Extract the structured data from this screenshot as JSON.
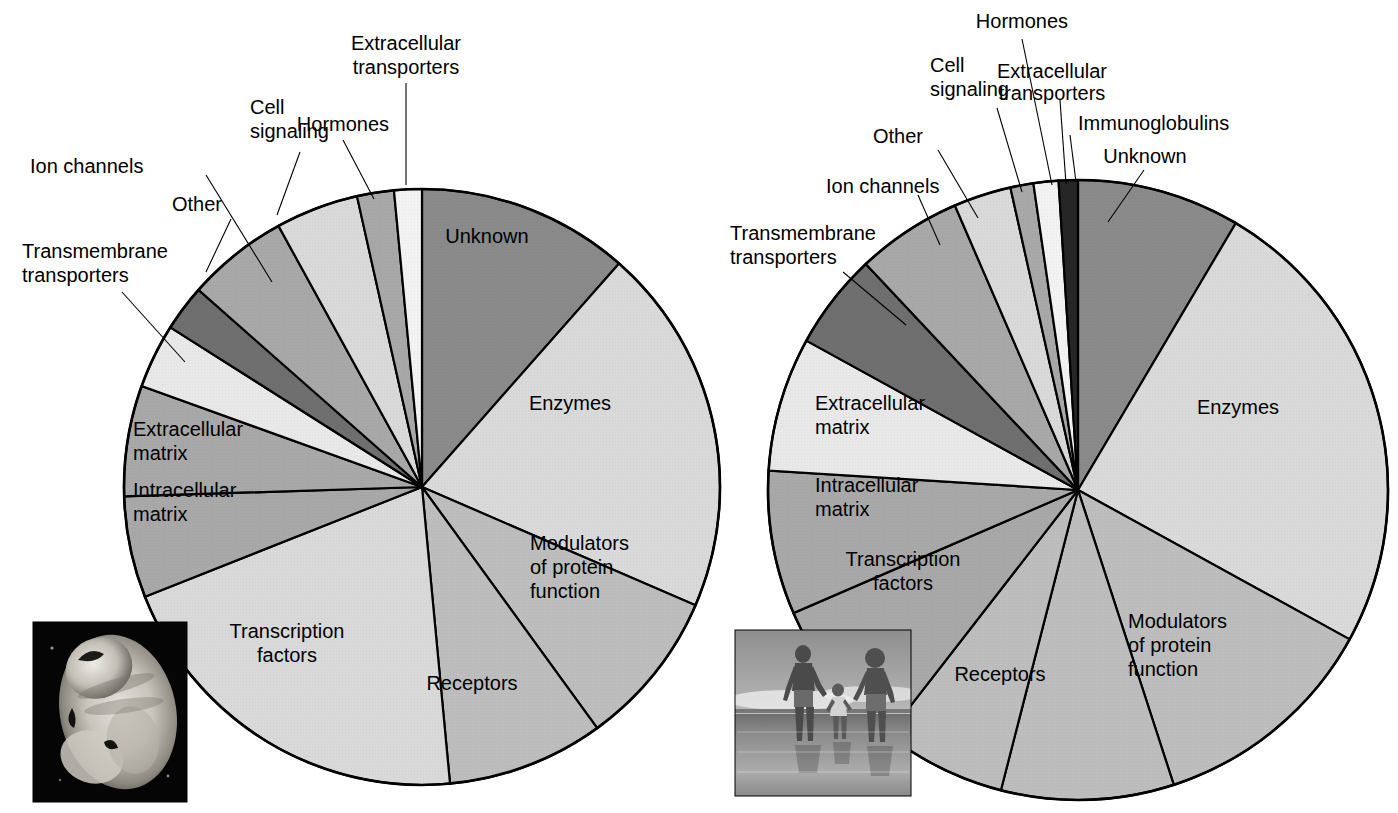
{
  "figure": {
    "background_color": "#ffffff",
    "line_color": "#000000",
    "text_color": "#000000"
  },
  "palette": {
    "light1": "#d9d9d9",
    "light2": "#e8e8e8",
    "mid1": "#bdbdbd",
    "mid2": "#a8a8a8",
    "dark1": "#8a8a8a",
    "dark2": "#6f6f6f",
    "darkest": "#262626",
    "white": "#f2f2f2"
  },
  "charts": [
    {
      "id": "left-pie",
      "name": "left-pie-chart",
      "inset_caption": "embryo-photograph",
      "inset_kind": "photo",
      "center": {
        "x": 422,
        "y": 487
      },
      "radius": 298
    },
    {
      "id": "right-pie",
      "name": "right-pie-chart",
      "inset_caption": "family-walking-on-beach-photograph",
      "inset_kind": "photo",
      "center": {
        "x": 1078,
        "y": 490
      },
      "radius": 310
    }
  ],
  "chart_data": [
    {
      "type": "pie",
      "id": "left-pie",
      "title": "",
      "legend": "none",
      "start_angle_deg": 0,
      "direction": "clockwise",
      "categories": [
        "Unknown",
        "Enzymes",
        "Modulators of protein function",
        "Receptors",
        "Transcription factors",
        "Intracellular matrix",
        "Extracellular matrix",
        "Transmembrane transporters",
        "Ion channels",
        "Other",
        "Cell signaling",
        "Hormones",
        "Extracellular transporters"
      ],
      "values": [
        11.5,
        20.0,
        8.5,
        8.5,
        20.5,
        5.5,
        6.0,
        3.5,
        2.5,
        5.5,
        4.5,
        2.0,
        1.5
      ],
      "units": "percent",
      "labels_inside": [
        "Unknown",
        "Enzymes",
        "Modulators of protein function",
        "Receptors",
        "Transcription factors",
        "Intracellular matrix",
        "Extracellular matrix"
      ],
      "labels_callout": [
        "Transmembrane transporters",
        "Ion channels",
        "Other",
        "Cell signaling",
        "Hormones",
        "Extracellular transporters"
      ]
    },
    {
      "type": "pie",
      "id": "right-pie",
      "title": "",
      "legend": "none",
      "start_angle_deg": 0,
      "direction": "clockwise",
      "categories": [
        "Unknown",
        "Enzymes",
        "Modulators of protein function",
        "Receptors",
        "Transcription factors",
        "Intracellular matrix",
        "Extracellular matrix",
        "Transmembrane transporters",
        "Ion channels",
        "Other",
        "Cell signaling",
        "Hormones",
        "Extracellular transporters",
        "Immunoglobulins"
      ],
      "values": [
        8.5,
        24.5,
        12.0,
        9.0,
        6.5,
        8.0,
        7.5,
        7.0,
        5.0,
        5.5,
        3.0,
        1.2,
        1.3,
        1.0
      ],
      "units": "percent",
      "labels_inside": [
        "Unknown",
        "Enzymes",
        "Modulators of protein function",
        "Receptors",
        "Transcription factors",
        "Intracellular matrix",
        "Extracellular matrix"
      ],
      "labels_callout": [
        "Transmembrane transporters",
        "Ion channels",
        "Other",
        "Cell signaling",
        "Hormones",
        "Extracellular transporters",
        "Immunoglobulins"
      ]
    }
  ],
  "left": {
    "inside_labels": {
      "unknown": "Unknown",
      "enzymes": "Enzymes",
      "modulators_1": "Modulators",
      "modulators_2": "of protein",
      "modulators_3": "function",
      "receptors": "Receptors",
      "transcription_1": "Transcription",
      "transcription_2": "factors",
      "intracellular_1": "Intracellular",
      "intracellular_2": "matrix",
      "extracellular_1": "Extracellular",
      "extracellular_2": "matrix"
    },
    "callout_labels": {
      "extracellular_transporters_1": "Extracellular",
      "extracellular_transporters_2": "transporters",
      "hormones": "Hormones",
      "cell_signaling_1": "Cell",
      "cell_signaling_2": "signaling",
      "ion_channels": "Ion channels",
      "other": "Other",
      "transmembrane_1": "Transmembrane",
      "transmembrane_2": "transporters"
    }
  },
  "right": {
    "inside_labels": {
      "unknown": "Unknown",
      "enzymes": "Enzymes",
      "modulators_1": "Modulators",
      "modulators_2": "of protein",
      "modulators_3": "function",
      "receptors": "Receptors",
      "transcription_1": "Transcription",
      "transcription_2": "factors",
      "intracellular_1": "Intracellular",
      "intracellular_2": "matrix",
      "extracellular_1": "Extracellular",
      "extracellular_2": "matrix"
    },
    "callout_labels": {
      "hormones": "Hormones",
      "cell_signaling_1": "Cell",
      "cell_signaling_2": "signaling",
      "extracellular_transporters_1": "Extracellular",
      "extracellular_transporters_2": "transporters",
      "immunoglobulins": "Immunoglobulins",
      "unknown_callout": "Unknown",
      "other": "Other",
      "ion_channels": "Ion channels",
      "transmembrane_1": "Transmembrane",
      "transmembrane_2": "transporters"
    }
  }
}
